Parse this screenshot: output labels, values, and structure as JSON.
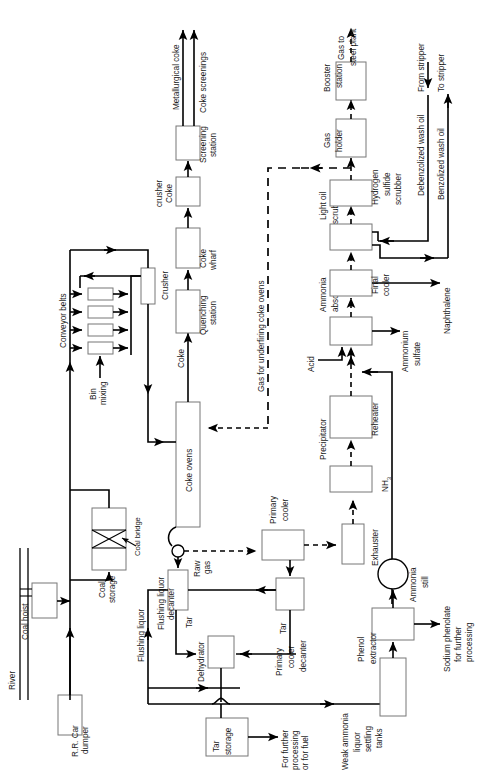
{
  "diagram": {
    "orientation": "rotated-90-ccw",
    "labels": {
      "river": "River",
      "rr_car_dumper": "R.R. Car\ndumper",
      "rr_car_dumper_l1": "R.R. Car",
      "rr_car_dumper_l2": "dumper",
      "coal_hoist": "Coal hoist",
      "coal_storage_l1": "Coal",
      "coal_storage_l2": "storage",
      "coal_bridge": "Coal bridge",
      "conveyor_belts": "Conveyor belts",
      "bin_mixing_l1": "Bin",
      "bin_mixing_l2": "mixing",
      "crusher": "Crusher",
      "coke_ovens": "Coke ovens",
      "coke": "Coke",
      "quenching_station_l1": "Quenching",
      "quenching_station_l2": "station",
      "coke_wharf_l1": "Coke",
      "coke_wharf_l2": "wharf",
      "coke_crusher_l1": "Coke",
      "coke_crusher_l2": "crusher",
      "screening_station_l1": "Screening",
      "screening_station_l2": "station",
      "metallurgical_coke": "Metallurgical coke",
      "coke_screenings": "Coke screenings",
      "raw_gas_l1": "Raw",
      "raw_gas_l2": "gas",
      "flushing_liquor": "Flushing liquor",
      "flushing_liquor_decanter_l1": "Flushing liquor",
      "flushing_liquor_decanter_l2": "decanter",
      "tar": "Tar",
      "dehydrator": "Dehydrator",
      "tar_storage_l1": "Tar",
      "tar_storage_l2": "storage",
      "for_further_processing_l1": "For further",
      "for_further_processing_l2": "processing",
      "for_further_processing_l3": "or for fuel",
      "primary_cooler_l1": "Primary",
      "primary_cooler_l2": "cooler",
      "primary_cooler_decanter_l1": "Primary",
      "primary_cooler_decanter_l2": "cooler",
      "primary_cooler_decanter_l3": "decanter",
      "exhauster": "Exhauster",
      "precipitator": "Precipitator",
      "reheater": "Reheater",
      "weak_ammonia_l1": "Weak ammonia",
      "weak_ammonia_l2": "liquor",
      "weak_ammonia_l3": "settling",
      "weak_ammonia_l4": "tanks",
      "phenol_extractor_l1": "Phenol",
      "phenol_extractor_l2": "extractor",
      "sodium_phenolate_l1": "Sodium phenolate",
      "sodium_phenolate_l2": "for further",
      "sodium_phenolate_l3": "processing",
      "ammonia_still_l1": "Ammonia",
      "ammonia_still_l2": "still",
      "nh3": "NH3",
      "acid": "Acid",
      "ammonia_absorber_l1": "Ammonia",
      "ammonia_absorber_l2": "absorber",
      "ammonium_sulfate_l1": "Ammonium",
      "ammonium_sulfate_l2": "sulfate",
      "final_cooler_l1": "Final",
      "final_cooler_l2": "cooler",
      "naphthalene": "Naphthalene",
      "light_oil_scrubber_l1": "Light oil",
      "light_oil_scrubber_l2": "scrubber",
      "hydrogen_sulfide_scrubber_l1": "Hydrogen",
      "hydrogen_sulfide_scrubber_l2": "sulfide",
      "hydrogen_sulfide_scrubber_l3": "scrubber",
      "gas_holder_l1": "Gas",
      "gas_holder_l2": "holder",
      "booster_station_l1": "Booster",
      "booster_station_l2": "station",
      "gas_to_steel_plant_l1": "Gas to",
      "gas_to_steel_plant_l2": "steel plant",
      "gas_for_underfiring": "Gas for underfiring coke ovens",
      "debenzolized_wash_oil": "Debenzolized wash oil",
      "benzolized_wash_oil": "Benzolized wash oil",
      "from_stripper": "From stripper",
      "to_stripper": "To stripper"
    },
    "colors": {
      "line": "#000000",
      "box_stroke": "#777777",
      "box_fill": "#ffffff",
      "text": "#1a1a1a",
      "background": "#ffffff"
    }
  }
}
